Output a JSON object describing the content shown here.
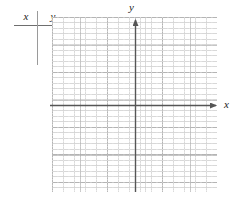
{
  "figure": {
    "kind": "coordinate-grid-worksheet",
    "background_color": "#ffffff"
  },
  "value_table": {
    "name": "xy-value-table",
    "columns": [
      "x",
      "y"
    ],
    "rows": [],
    "rule_color": "#6e6e6e",
    "divider_color": "#9a9a9a"
  },
  "grid": {
    "name": "coordinate-grid",
    "minor_cell_px": 5.5,
    "major_every_minor_cells": 5,
    "minor_line_color": "#b2b2b2",
    "major_line_color": "#969696",
    "left_px": 52,
    "top_px": 17,
    "width_px": 165,
    "height_px": 175,
    "grid_on": true
  },
  "axes": {
    "name": "cartesian-axes",
    "origin_px": {
      "x": 135,
      "y": 105
    },
    "color": "#555555",
    "x_axis": {
      "label": "x",
      "start_px": {
        "x": 50,
        "y": 105
      },
      "end_px": {
        "x": 220,
        "y": 105
      },
      "arrow": "right"
    },
    "y_axis": {
      "label": "y",
      "start_px": {
        "x": 135,
        "y": 192
      },
      "end_px": {
        "x": 135,
        "y": 15
      },
      "arrow": "up"
    },
    "tick_labels_x": [],
    "tick_labels_y": []
  }
}
